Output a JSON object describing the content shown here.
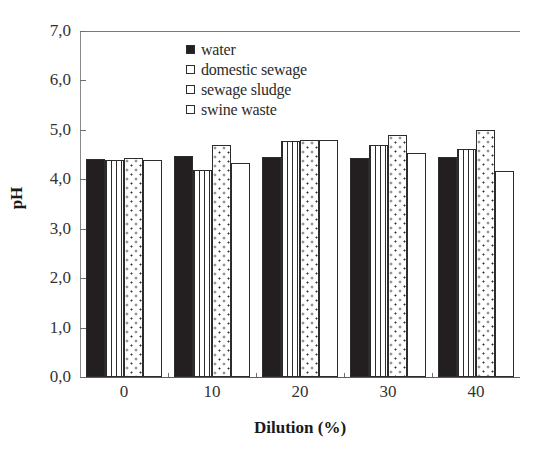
{
  "chart_data": {
    "type": "bar",
    "title": "",
    "xlabel": "Dilution (%)",
    "ylabel": "pH",
    "categories": [
      "0",
      "10",
      "20",
      "30",
      "40"
    ],
    "ylim": [
      0.0,
      7.0
    ],
    "ytick_labels": [
      "0,0",
      "1,0",
      "2,0",
      "3,0",
      "4,0",
      "5,0",
      "6,0",
      "7,0"
    ],
    "ytick_values": [
      0.0,
      1.0,
      2.0,
      3.0,
      4.0,
      5.0,
      6.0,
      7.0
    ],
    "xtick_labels": [
      "0",
      "10",
      "20",
      "30",
      "40"
    ],
    "grid": false,
    "legend_position": "upper-center",
    "series": [
      {
        "name": "water",
        "pattern": "solid-black",
        "values": [
          4.42,
          4.47,
          4.45,
          4.43,
          4.46
        ]
      },
      {
        "name": "domestic sewage",
        "pattern": "vertical-lines",
        "values": [
          4.4,
          4.18,
          4.78,
          4.7,
          4.62
        ]
      },
      {
        "name": "sewage sludge",
        "pattern": "dotted",
        "values": [
          4.43,
          4.7,
          4.8,
          4.9,
          5.0
        ]
      },
      {
        "name": "swine waste",
        "pattern": "open-white",
        "values": [
          4.4,
          4.33,
          4.8,
          4.53,
          4.17
        ]
      }
    ]
  },
  "legend": {
    "items": [
      {
        "label": "water",
        "swatch": "filled-square-icon"
      },
      {
        "label": "domestic sewage",
        "swatch": "open-square-icon"
      },
      {
        "label": "sewage sludge",
        "swatch": "open-square-icon"
      },
      {
        "label": "swine waste",
        "swatch": "open-square-icon"
      }
    ]
  }
}
